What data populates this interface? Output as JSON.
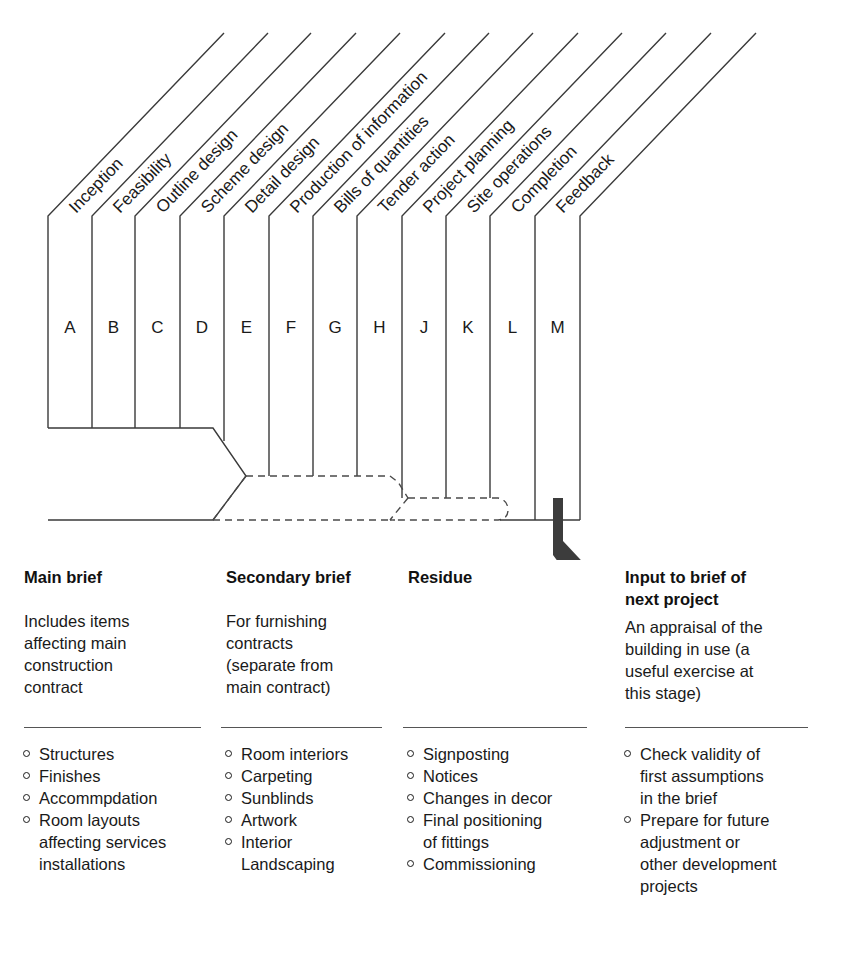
{
  "diagram": {
    "stages": [
      {
        "letter": "A",
        "label": "Inception"
      },
      {
        "letter": "B",
        "label": "Feasibility"
      },
      {
        "letter": "C",
        "label": "Outline design"
      },
      {
        "letter": "D",
        "label": "Scheme design"
      },
      {
        "letter": "E",
        "label": "Detail design"
      },
      {
        "letter": "F",
        "label": "Production of information"
      },
      {
        "letter": "G",
        "label": "Bills of quantities"
      },
      {
        "letter": "H",
        "label": "Tender action"
      },
      {
        "letter": "J",
        "label": "Project planning"
      },
      {
        "letter": "K",
        "label": "Site operations"
      },
      {
        "letter": "L",
        "label": "Completion"
      },
      {
        "letter": "M",
        "label": "Feedback"
      }
    ],
    "line_color": "#3a3a3a",
    "arrow_color": "#3c3c3c"
  },
  "columns": [
    {
      "heading": "Main brief",
      "description": [
        "Includes items",
        "affecting main",
        "construction",
        "contract"
      ],
      "items": [
        [
          "Structures"
        ],
        [
          "Finishes"
        ],
        [
          "Accommpdation"
        ],
        [
          "Room layouts",
          "affecting services",
          "installations"
        ]
      ]
    },
    {
      "heading": "Secondary brief",
      "description": [
        "For furnishing",
        "contracts",
        "(separate from",
        "main contract)"
      ],
      "items": [
        [
          "Room interiors"
        ],
        [
          "Carpeting"
        ],
        [
          "Sunblinds"
        ],
        [
          "Artwork"
        ],
        [
          "Interior",
          "Landscaping"
        ]
      ]
    },
    {
      "heading": "Residue",
      "description": [],
      "items": [
        [
          "Signposting"
        ],
        [
          "Notices"
        ],
        [
          "Changes in decor"
        ],
        [
          "Final positioning",
          "of fittings"
        ],
        [
          "Commissioning"
        ]
      ]
    },
    {
      "heading_lines": [
        "Input to brief of",
        "next project"
      ],
      "description": [
        "An appraisal of the",
        "building in use (a",
        "useful exercise at",
        "this stage)"
      ],
      "items": [
        [
          "Check validity of",
          "first assumptions",
          "in the brief"
        ],
        [
          "Prepare for future",
          "adjustment or",
          "other development",
          "projects"
        ]
      ]
    }
  ]
}
